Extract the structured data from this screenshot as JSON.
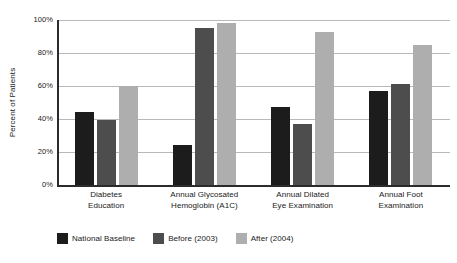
{
  "chart_data": {
    "type": "bar",
    "title": "",
    "subtitle": "",
    "xlabel": "",
    "ylabel": "Percent of Patients",
    "ylim": [
      0,
      100
    ],
    "ytick_labels": [
      "100%",
      "80%",
      "60%",
      "40%",
      "20%",
      "0%"
    ],
    "ytick_values": [
      100,
      80,
      60,
      40,
      20,
      0
    ],
    "grid": true,
    "grid_axis": "y",
    "legend_position": "bottom-left",
    "categories": [
      "Diabetes Education",
      "Annual Glycosated Hemoglobin (A1C)",
      "Annual Dilated Eye Examination",
      "Annual Foot Examination"
    ],
    "category_lines": [
      [
        "Diabetes",
        "Education"
      ],
      [
        "Annual Glycosated",
        "Hemoglobin (A1C)"
      ],
      [
        "Annual Dilated",
        "Eye Examination"
      ],
      [
        "Annual Foot",
        "Examination"
      ]
    ],
    "series": [
      {
        "name": "National Baseline",
        "color": "#1c1c1c",
        "values": [
          44,
          24,
          47,
          57
        ]
      },
      {
        "name": "Before (2003)",
        "color": "#4d4d4d",
        "values": [
          39.5,
          95,
          37,
          61.5
        ]
      },
      {
        "name": "After (2004)",
        "color": "#aeaeae",
        "values": [
          60,
          98,
          92.5,
          85
        ]
      }
    ]
  },
  "axes": {
    "y_title": "Percent of Patients",
    "axis_color": "#2b2b2b",
    "gridline_color": "#b9b9b9"
  },
  "legend": {
    "items": [
      {
        "label": "National Baseline",
        "color": "#1c1c1c"
      },
      {
        "label": "Before (2003)",
        "color": "#4d4d4d"
      },
      {
        "label": "After (2004)",
        "color": "#aeaeae"
      }
    ]
  }
}
